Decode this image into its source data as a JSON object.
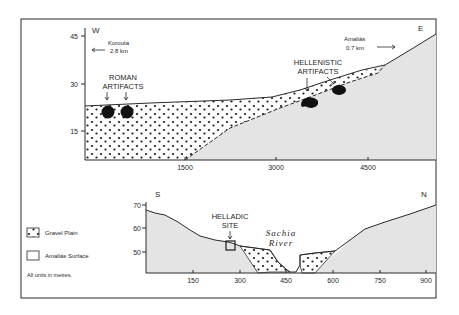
{
  "top_section": {
    "left_direction": "W",
    "right_direction": "E",
    "left_town": "Korouta",
    "left_distance": "2.8 km",
    "right_town": "Amaliás",
    "right_distance": "0.7 km",
    "y_ticks": [
      "45",
      "30",
      "15"
    ],
    "x_ticks": [
      "1500",
      "3000",
      "4500"
    ],
    "annotation_roman_line1": "ROMAN",
    "annotation_roman_line2": "ARTIFACTS",
    "annotation_hellenistic_line1": "HELLENISTIC",
    "annotation_hellenistic_line2": "ARTIFACTS"
  },
  "bottom_section": {
    "left_direction": "S",
    "right_direction": "N",
    "y_ticks": [
      "70",
      "60",
      "50"
    ],
    "x_ticks": [
      "150",
      "300",
      "450",
      "600",
      "750",
      "900"
    ],
    "annotation_helladic_line1": "HELLADIC",
    "annotation_helladic_line2": "SITE",
    "river_line1": "Sachia",
    "river_line2": "River"
  },
  "legend": {
    "items": [
      {
        "label": "Gravel Plain",
        "pattern": "dotted"
      },
      {
        "label": "Amaliás Surface",
        "pattern": "blank"
      }
    ],
    "note": "All units in metres."
  },
  "colors": {
    "bedrock_fill": "#e4e4e4",
    "line": "#2a2a2a",
    "dot": "#1a1a1a"
  }
}
